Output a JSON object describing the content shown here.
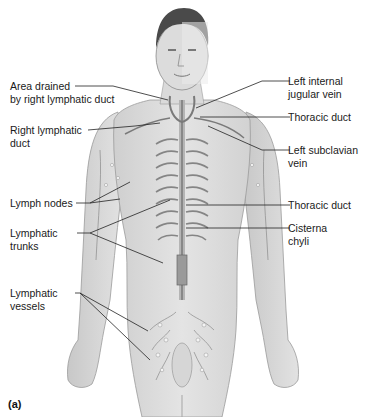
{
  "figure": {
    "panel_label": "(a)",
    "labels_left": [
      {
        "id": "area-drained",
        "lines": [
          "Area drained",
          "by right lymphatic duct"
        ]
      },
      {
        "id": "right-lymphatic-duct",
        "lines": [
          "Right lymphatic",
          "duct"
        ]
      },
      {
        "id": "lymph-nodes",
        "lines": [
          "Lymph nodes"
        ]
      },
      {
        "id": "lymphatic-trunks",
        "lines": [
          "Lymphatic",
          "trunks"
        ]
      },
      {
        "id": "lymphatic-vessels",
        "lines": [
          "Lymphatic",
          "vessels"
        ]
      }
    ],
    "labels_right": [
      {
        "id": "left-internal-jugular-vein",
        "lines": [
          "Left internal",
          "jugular vein"
        ]
      },
      {
        "id": "thoracic-duct-upper",
        "lines": [
          "Thoracic duct"
        ]
      },
      {
        "id": "left-subclavian-vein",
        "lines": [
          "Left subclavian",
          "vein"
        ]
      },
      {
        "id": "thoracic-duct-lower",
        "lines": [
          "Thoracic duct"
        ]
      },
      {
        "id": "cisterna-chyli",
        "lines": [
          "Cisterna",
          "chyli"
        ]
      }
    ],
    "colors": {
      "skin_light": "#e6e6e6",
      "skin_shaded": "#cfcfcf",
      "skin_edge": "#9a9a9a",
      "hair": "#4a4a4a",
      "vessel": "#7a7a7a",
      "leader_line": "#222222"
    }
  }
}
